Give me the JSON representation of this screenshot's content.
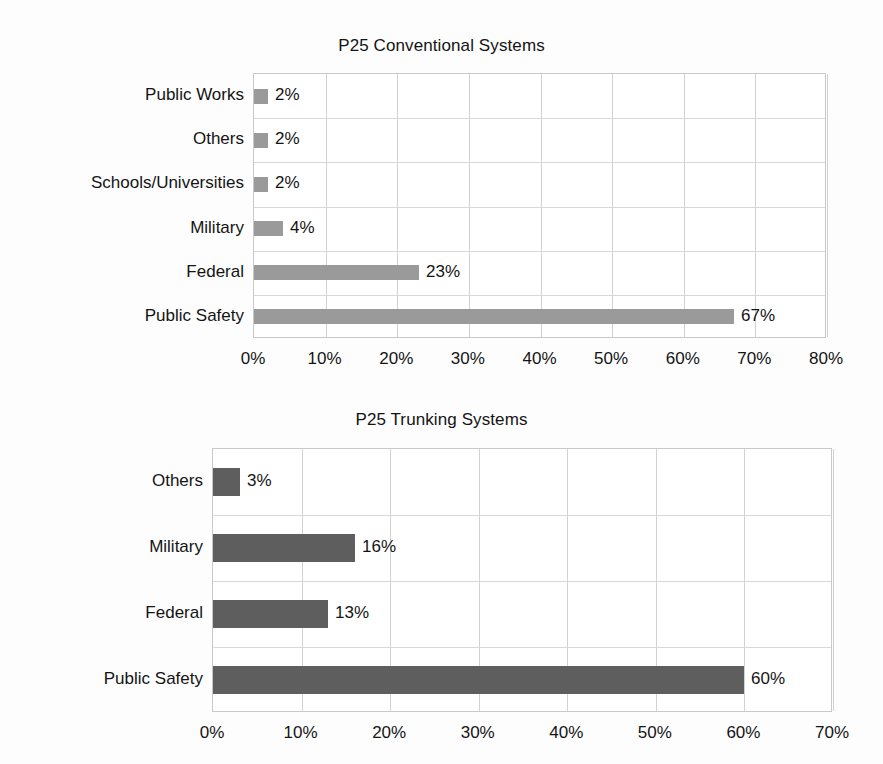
{
  "figure": {
    "background_color": "#fdfdfd",
    "text_color": "#141414"
  },
  "charts": [
    {
      "id": "p25-conventional-systems",
      "title": "P25 Conventional Systems",
      "bar_color": "#9a9a9a",
      "plot": {
        "left": 253,
        "top": 73,
        "width": 573,
        "height": 265
      },
      "title_top": 36,
      "axis_label_top": 349,
      "chart_data": {
        "type": "bar",
        "orientation": "horizontal",
        "title": "P25 Conventional Systems",
        "xlabel": "",
        "ylabel": "",
        "categories": [
          "Public Works",
          "Others",
          "Schools/Universities",
          "Military",
          "Federal",
          "Public Safety"
        ],
        "values": [
          2,
          2,
          2,
          4,
          23,
          67
        ],
        "data_labels": [
          "2%",
          "2%",
          "2%",
          "4%",
          "23%",
          "67%"
        ],
        "xlim": [
          0,
          80
        ],
        "xticks": [
          0,
          10,
          20,
          30,
          40,
          50,
          60,
          70,
          80
        ],
        "xticklabels": [
          "0%",
          "10%",
          "20%",
          "30%",
          "40%",
          "50%",
          "60%",
          "70%",
          "80%"
        ],
        "grid": true,
        "legend": false
      }
    },
    {
      "id": "p25-trunking-systems",
      "title": "P25 Trunking Systems",
      "bar_color": "#5e5e5e",
      "plot": {
        "left": 212,
        "top": 448,
        "width": 620,
        "height": 264
      },
      "title_top": 410,
      "axis_label_top": 723,
      "chart_data": {
        "type": "bar",
        "orientation": "horizontal",
        "title": "P25 Trunking Systems",
        "xlabel": "",
        "ylabel": "",
        "categories": [
          "Others",
          "Military",
          "Federal",
          "Public Safety"
        ],
        "values": [
          3,
          16,
          13,
          60
        ],
        "data_labels": [
          "3%",
          "16%",
          "13%",
          "60%"
        ],
        "xlim": [
          0,
          70
        ],
        "xticks": [
          0,
          10,
          20,
          30,
          40,
          50,
          60,
          70
        ],
        "xticklabels": [
          "0%",
          "10%",
          "20%",
          "30%",
          "40%",
          "50%",
          "60%",
          "70%"
        ],
        "grid": true,
        "legend": false
      }
    }
  ]
}
